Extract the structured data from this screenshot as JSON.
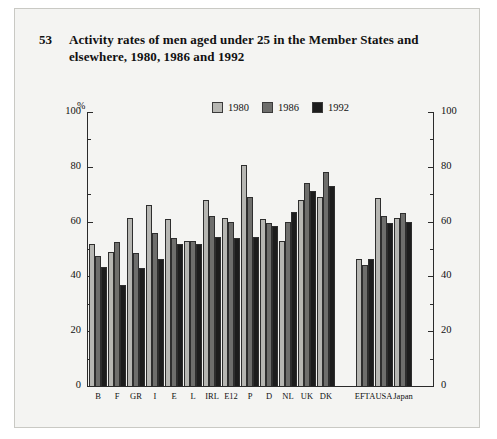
{
  "figure": {
    "number": "53",
    "title": "Activity rates of men aged under 25 in the Member States and elsewhere, 1980, 1986 and 1992"
  },
  "legend": {
    "position": "top-center",
    "items": [
      {
        "label": "1980",
        "color": "#b6b6b2"
      },
      {
        "label": "1986",
        "color": "#6e6e6c"
      },
      {
        "label": "1992",
        "color": "#1d1d1d"
      }
    ]
  },
  "axis": {
    "unit_label": "%",
    "left_ticks": [
      "0",
      "20",
      "40",
      "60",
      "80",
      "100"
    ],
    "right_ticks": [
      "0",
      "20",
      "40",
      "60",
      "80",
      "100"
    ]
  },
  "chart_data": {
    "type": "bar",
    "title": "Activity rates of men aged under 25 in the Member States and elsewhere, 1980, 1986 and 1992",
    "xlabel": "",
    "ylabel": "%",
    "ylim": [
      0,
      100
    ],
    "yticks": [
      0,
      20,
      40,
      60,
      80,
      100
    ],
    "grid": false,
    "legend_position": "top-center",
    "categories": [
      "B",
      "F",
      "GR",
      "I",
      "E",
      "L",
      "IRL",
      "E12",
      "P",
      "D",
      "NL",
      "UK",
      "DK",
      "EFTA",
      "USA",
      "Japan"
    ],
    "group_break_after": "DK",
    "series": [
      {
        "name": "1980",
        "color": "#b6b6b2",
        "values": [
          52,
          49,
          61.5,
          66,
          61,
          53,
          68,
          61.5,
          80.5,
          61,
          53,
          68,
          69,
          46.5,
          68.5,
          61.5
        ]
      },
      {
        "name": "1986",
        "color": "#6e6e6c",
        "values": [
          47.5,
          52.5,
          48.5,
          56,
          54,
          53,
          62,
          60,
          69,
          59.5,
          60,
          74,
          78,
          44,
          62,
          63
        ]
      },
      {
        "name": "1992",
        "color": "#1d1d1d",
        "values": [
          43.5,
          37,
          43,
          46.5,
          52,
          52,
          54.5,
          54,
          54.5,
          58.5,
          63.5,
          71,
          73,
          46.5,
          59.5,
          60
        ]
      }
    ]
  }
}
